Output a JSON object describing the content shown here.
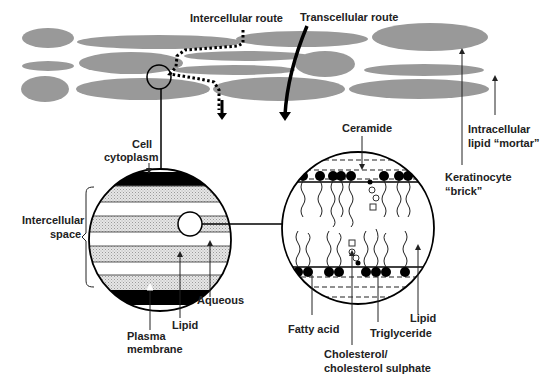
{
  "colors": {
    "cell_fill": "#999999",
    "line": "#111111",
    "stipple": "#d6d6d6",
    "membrane": "#000000",
    "label": "#222222"
  },
  "routes": {
    "intercellular": "Intercellular route",
    "transcellular": "Transcellular route"
  },
  "top_labels": {
    "intracellular_line1": "Intracellular",
    "intracellular_line2": "lipid “mortar”",
    "keratinocyte_line1": "Keratinocyte",
    "keratinocyte_line2": "“brick”"
  },
  "left_circle": {
    "cell_line1": "Cell",
    "cell_line2": "cytoplasm",
    "intercellular_line1": "Intercellular",
    "intercellular_line2": "space",
    "aqueous": "Aqueous",
    "lipid": "Lipid",
    "plasma_line1": "Plasma",
    "plasma_line2": "membrane"
  },
  "right_circle": {
    "ceramide": "Ceramide",
    "fatty_acid": "Fatty acid",
    "triglyceride": "Triglyceride",
    "lipid": "Lipid",
    "cholesterol_line1": "Cholesterol/",
    "cholesterol_line2": "cholesterol sulphate"
  }
}
